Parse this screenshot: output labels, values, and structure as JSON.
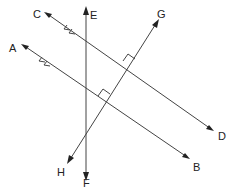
{
  "diagram": {
    "type": "geometry-lines",
    "labels": {
      "A": "A",
      "B": "B",
      "C": "C",
      "D": "D",
      "E": "E",
      "F": "F",
      "G": "G",
      "H": "H"
    },
    "lines": [
      {
        "name": "CD",
        "from": "C",
        "to": "D",
        "parallel_marks": 2
      },
      {
        "name": "AB",
        "from": "A",
        "to": "B",
        "parallel_marks": 2
      },
      {
        "name": "EF",
        "from": "E",
        "to": "F"
      },
      {
        "name": "GH",
        "from": "G",
        "to": "H",
        "perpendicular_to": [
          "CD",
          "AB"
        ]
      }
    ],
    "right_angles": [
      "GH ⟂ CD",
      "GH ⟂ AB"
    ],
    "colors": {
      "line": "#444444",
      "text": "#222222",
      "background": "#ffffff"
    }
  }
}
